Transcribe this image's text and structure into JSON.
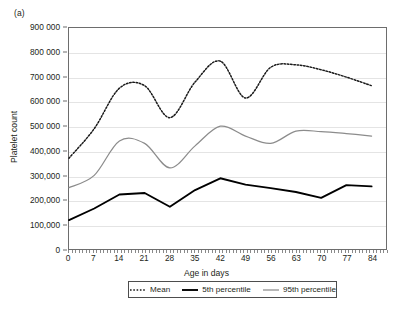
{
  "figure": {
    "panel_label": "(a)",
    "y_axis_title": "Platelet count",
    "x_axis_title": "Age in days"
  },
  "legend": {
    "items": [
      {
        "label": "Mean",
        "style": "dotted",
        "color": "#1a1a1a"
      },
      {
        "label": "5th percentile",
        "style": "solid-thick",
        "color": "#000000"
      },
      {
        "label": "95th percentile",
        "style": "solid-thin",
        "color": "#8c8c8c"
      }
    ]
  },
  "axes": {
    "y_ticks": [
      {
        "value": 900000,
        "label": "900 000"
      },
      {
        "value": 800000,
        "label": "800 000"
      },
      {
        "value": 700000,
        "label": "700 000"
      },
      {
        "value": 600000,
        "label": "600 000"
      },
      {
        "value": 500000,
        "label": "500 000"
      },
      {
        "value": 400000,
        "label": "400,000"
      },
      {
        "value": 300000,
        "label": "300,000"
      },
      {
        "value": 200000,
        "label": "200,000"
      },
      {
        "value": 100000,
        "label": "100,000"
      },
      {
        "value": 0,
        "label": "0"
      }
    ],
    "x_ticks": [
      {
        "value": 0,
        "label": "0"
      },
      {
        "value": 7,
        "label": "7"
      },
      {
        "value": 14,
        "label": "14"
      },
      {
        "value": 21,
        "label": "21"
      },
      {
        "value": 28,
        "label": "28"
      },
      {
        "value": 35,
        "label": "35"
      },
      {
        "value": 42,
        "label": "42"
      },
      {
        "value": 49,
        "label": "49"
      },
      {
        "value": 56,
        "label": "56"
      },
      {
        "value": 63,
        "label": "63"
      },
      {
        "value": 70,
        "label": "70"
      },
      {
        "value": 77,
        "label": "77"
      },
      {
        "value": 84,
        "label": "84"
      }
    ]
  },
  "chart_data": {
    "type": "line",
    "title": "(a)",
    "xlabel": "Age in days",
    "ylabel": "Platelet count",
    "xlim": [
      0,
      88
    ],
    "ylim": [
      0,
      900000
    ],
    "grid": true,
    "legend_position": "bottom",
    "x": [
      0,
      7,
      14,
      21,
      28,
      35,
      42,
      49,
      56,
      63,
      70,
      77,
      84
    ],
    "series": [
      {
        "name": "Mean",
        "style": "dotted",
        "color": "#1a1a1a",
        "values": [
          370000,
          490000,
          655000,
          665000,
          535000,
          680000,
          765000,
          615000,
          740000,
          750000,
          730000,
          700000,
          665000
        ]
      },
      {
        "name": "5th percentile",
        "style": "solid-thick",
        "color": "#000000",
        "values": [
          118000,
          165000,
          222000,
          228000,
          172000,
          240000,
          288000,
          262000,
          248000,
          232000,
          208000,
          260000,
          255000
        ]
      },
      {
        "name": "95th percentile",
        "style": "solid-thin",
        "color": "#8c8c8c",
        "values": [
          250000,
          300000,
          440000,
          430000,
          330000,
          420000,
          500000,
          460000,
          430000,
          480000,
          478000,
          470000,
          460000
        ]
      }
    ]
  }
}
